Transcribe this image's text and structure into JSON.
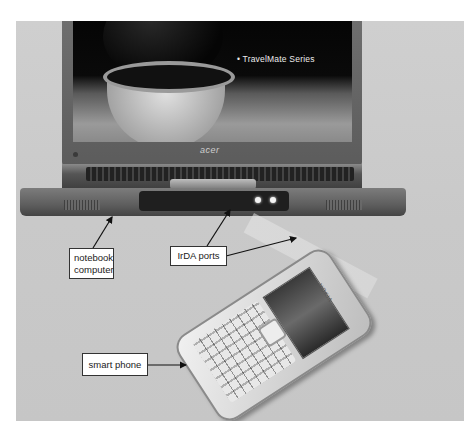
{
  "figure": {
    "screen_text": "• TravelMate Series",
    "laptop_logo": "acer",
    "phone_brand": "NOKIA"
  },
  "callouts": {
    "notebook": "notebook computer",
    "irda": "IrDA ports",
    "phone": "smart phone"
  },
  "colors": {
    "background": "#c9c9c9",
    "callout_border": "#333333",
    "callout_fill": "#ffffff"
  }
}
